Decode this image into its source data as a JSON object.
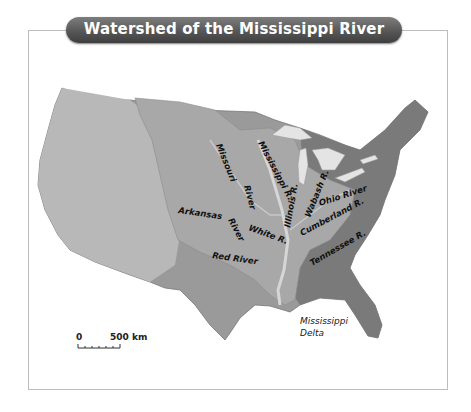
{
  "title": "Watershed of the Mississippi River",
  "rivers": {
    "missouri_1": "Missouri",
    "missouri_2": "River",
    "mississippi": "Mississippi R.",
    "illinois": "Illinois R.",
    "wabash": "Wabash R.",
    "ohio": "Ohio River",
    "cumberland": "Cumberland R.",
    "tennessee": "Tennessee R.",
    "arkansas_1": "Arkansas",
    "arkansas_2": "River",
    "white": "White R.",
    "red": "Red River"
  },
  "delta": {
    "line1": "Mississippi",
    "line2": "Delta"
  },
  "scale": {
    "start": "0",
    "end": "500 km"
  },
  "colors": {
    "banner": "#555555",
    "watershed": "#a9a9a9",
    "land": "#8a8a8a",
    "water": "#e8e8e8"
  }
}
